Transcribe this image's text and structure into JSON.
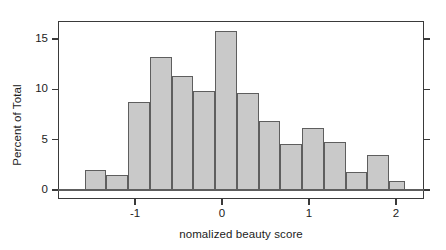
{
  "chart_data": {
    "type": "bar",
    "title": "",
    "xlabel": "nomalized beauty score",
    "ylabel": "Percent of Total",
    "xlim": [
      -1.62,
      2.12
    ],
    "ylim": [
      0,
      16.6
    ],
    "grid": false,
    "legend": null,
    "bin_width": 0.25,
    "xticks": [
      {
        "value": -1,
        "label": "-1"
      },
      {
        "value": 0,
        "label": "0"
      },
      {
        "value": 1,
        "label": "1"
      },
      {
        "value": 2,
        "label": "2"
      }
    ],
    "yticks": [
      {
        "value": 0,
        "label": "0"
      },
      {
        "value": 5,
        "label": "5"
      },
      {
        "value": 10,
        "label": "10"
      },
      {
        "value": 15,
        "label": "15"
      }
    ],
    "bins": [
      {
        "x0": -1.58,
        "x1": -1.33,
        "value": 2.0
      },
      {
        "x0": -1.33,
        "x1": -1.08,
        "value": 1.5
      },
      {
        "x0": -1.08,
        "x1": -0.83,
        "value": 8.7
      },
      {
        "x0": -0.83,
        "x1": -0.58,
        "value": 13.2
      },
      {
        "x0": -0.58,
        "x1": -0.33,
        "value": 11.3
      },
      {
        "x0": -0.33,
        "x1": -0.08,
        "value": 9.8
      },
      {
        "x0": -0.08,
        "x1": 0.17,
        "value": 15.8
      },
      {
        "x0": 0.17,
        "x1": 0.42,
        "value": 9.6
      },
      {
        "x0": 0.42,
        "x1": 0.67,
        "value": 6.9
      },
      {
        "x0": 0.67,
        "x1": 0.92,
        "value": 4.6
      },
      {
        "x0": 0.92,
        "x1": 1.17,
        "value": 6.2
      },
      {
        "x0": 1.17,
        "x1": 1.42,
        "value": 4.8
      },
      {
        "x0": 1.42,
        "x1": 1.67,
        "value": 1.75
      },
      {
        "x0": 1.67,
        "x1": 1.92,
        "value": 3.5
      },
      {
        "x0": 1.92,
        "x1": 2.1,
        "value": 0.85
      }
    ],
    "colors": {
      "bar_fill": "#c9c9c9",
      "bar_border": "#5e5e5e",
      "axis": "#3a3a3a",
      "text": "#1c1c1c",
      "background": "#ffffff"
    }
  }
}
